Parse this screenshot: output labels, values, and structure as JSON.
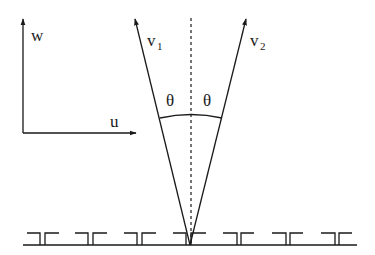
{
  "diagram": {
    "type": "vector-geometry",
    "colors": {
      "stroke": "#1a1a1a",
      "background": "#ffffff"
    },
    "axes": {
      "vertical_label": "w",
      "horizontal_label": "u"
    },
    "vectors": [
      {
        "name": "v",
        "subscript": "1"
      },
      {
        "name": "v",
        "subscript": "2"
      }
    ],
    "angles": [
      {
        "label": "θ"
      },
      {
        "label": "θ"
      }
    ],
    "center_line": "dashed vertical symmetry axis",
    "surface": {
      "description": "baseline with periodic comb-like teeth",
      "teeth_count": 7
    }
  }
}
